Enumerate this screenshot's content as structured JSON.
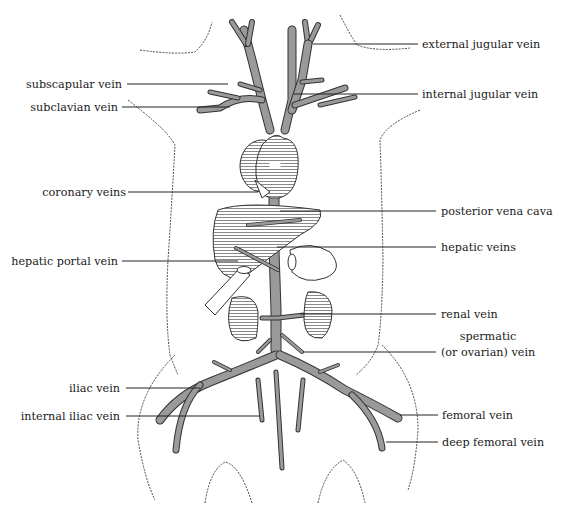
{
  "diagram": {
    "labels": {
      "external_jugular": "external jugular vein",
      "subscapular": "subscapular vein",
      "internal_jugular": "internal jugular vein",
      "subclavian": "subclavian vein",
      "coronary": "coronary veins",
      "posterior_vena_cava": "posterior vena cava",
      "hepatic_veins": "hepatic veins",
      "hepatic_portal": "hepatic portal vein",
      "renal": "renal vein",
      "spermatic_1": "spermatic",
      "spermatic_2": "(or ovarian) vein",
      "iliac": "iliac vein",
      "internal_iliac": "internal iliac vein",
      "femoral": "femoral vein",
      "deep_femoral": "deep femoral vein"
    },
    "colors": {
      "vein": "#9a9a9a",
      "ink": "#333333",
      "background": "#ffffff"
    }
  }
}
